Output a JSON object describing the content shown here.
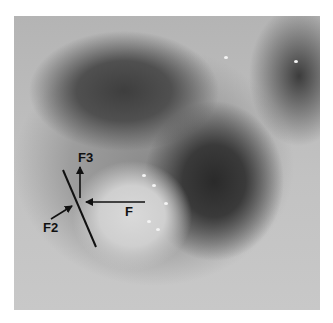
{
  "figure": {
    "labels": {
      "f": "F",
      "f2": "F2",
      "f3": "F3"
    },
    "annotation_color": "#111111",
    "background_color": "#ffffff"
  }
}
